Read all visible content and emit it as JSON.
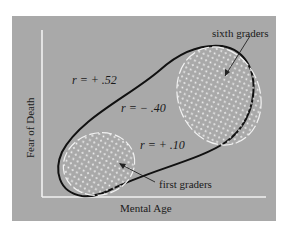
{
  "diagram": {
    "type": "correlation-scatter-schematic",
    "x_axis_label": "Mental Age",
    "y_axis_label": "Fear of Death",
    "groups": [
      {
        "name": "sixth graders",
        "label": "sixth graders",
        "correlation": "r = +.10",
        "position": "upper-right"
      },
      {
        "name": "first graders",
        "label": "first graders",
        "correlation": "r = +.10",
        "position": "lower-left"
      }
    ],
    "annotations": {
      "overall_correlation": "r = +.52",
      "within_sixth_graders": "r = −.40",
      "within_first_graders": "r = +.10"
    },
    "colors": {
      "panel_background": "#a9a9a9",
      "axes": "#f2f2f2",
      "outline": "#111111",
      "group_fill_dots": "#f5f5f5"
    }
  },
  "labels": {
    "r_overall": "r = + .52",
    "r_middle": "r = − .40",
    "r_first": "r = + .10",
    "sixth": "sixth graders",
    "first": "first graders",
    "xlabel": "Mental Age",
    "ylabel": "Fear of Death"
  }
}
